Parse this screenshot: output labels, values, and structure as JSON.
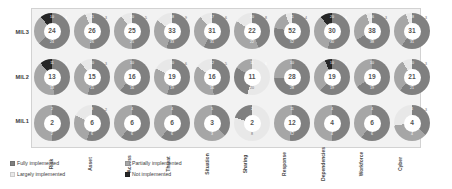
{
  "chart_data": {
    "type": "pie",
    "title": "",
    "subtitle": "",
    "xlabel": "",
    "ylabel": "",
    "grid": false,
    "legend_position": "bottom-left",
    "categories": [
      "Risk",
      "Asset",
      "Access",
      "Threat",
      "Situation",
      "Sharing",
      "Response",
      "Dependencies",
      "Workforce",
      "Cyber"
    ],
    "rows": [
      "MIL3",
      "MIL2",
      "MIL1"
    ],
    "series": [
      {
        "name": "Fully implemented",
        "color": "#808080"
      },
      {
        "name": "Largely implemented",
        "color": "#e8e8e8"
      },
      {
        "name": "Partially implemented",
        "color": "#a6a6a6"
      },
      {
        "name": "Not implemented",
        "color": "#262626"
      }
    ],
    "donuts": [
      {
        "row": "MIL3",
        "category": "Risk",
        "center": "24",
        "segments": [
          {
            "series": "Fully implemented",
            "value": 24,
            "label": "24"
          },
          {
            "series": "Partially implemented",
            "value": 10,
            "label": "10"
          },
          {
            "series": "Not implemented",
            "value": 4,
            "label": "4"
          }
        ]
      },
      {
        "row": "MIL3",
        "category": "Asset",
        "center": "26",
        "segments": [
          {
            "series": "Fully implemented",
            "value": 26,
            "label": "26"
          },
          {
            "series": "Partially implemented",
            "value": 21,
            "label": "21"
          },
          {
            "series": "Largely implemented",
            "value": 3,
            "label": "3"
          }
        ]
      },
      {
        "row": "MIL3",
        "category": "Access",
        "center": "25",
        "segments": [
          {
            "series": "Fully implemented",
            "value": 25,
            "label": "25"
          },
          {
            "series": "Partially implemented",
            "value": 20,
            "label": "20"
          },
          {
            "series": "Largely implemented",
            "value": 5,
            "label": "5"
          }
        ]
      },
      {
        "row": "MIL3",
        "category": "Threat",
        "center": "33",
        "segments": [
          {
            "series": "Fully implemented",
            "value": 33,
            "label": "33"
          },
          {
            "series": "Partially implemented",
            "value": 18,
            "label": "18"
          },
          {
            "series": "Largely implemented",
            "value": 9,
            "label": "9"
          }
        ]
      },
      {
        "row": "MIL3",
        "category": "Situation",
        "center": "31",
        "segments": [
          {
            "series": "Fully implemented",
            "value": 31,
            "label": "31"
          },
          {
            "series": "Partially implemented",
            "value": 17,
            "label": "17"
          },
          {
            "series": "Largely implemented",
            "value": 6,
            "label": "6"
          }
        ]
      },
      {
        "row": "MIL3",
        "category": "Sharing",
        "center": "22",
        "segments": [
          {
            "series": "Fully implemented",
            "value": 22,
            "label": "22"
          },
          {
            "series": "Partially implemented",
            "value": 20,
            "label": "20"
          },
          {
            "series": "Largely implemented",
            "value": 8,
            "label": "8"
          }
        ]
      },
      {
        "row": "MIL3",
        "category": "Response",
        "center": "52",
        "segments": [
          {
            "series": "Fully implemented",
            "value": 52,
            "label": "52"
          },
          {
            "series": "Partially implemented",
            "value": 11,
            "label": "11"
          },
          {
            "series": "Largely implemented",
            "value": 4,
            "label": "4"
          }
        ]
      },
      {
        "row": "MIL3",
        "category": "Dependencies",
        "center": "30",
        "segments": [
          {
            "series": "Fully implemented",
            "value": 30,
            "label": "30"
          },
          {
            "series": "Partially implemented",
            "value": 20,
            "label": "20"
          },
          {
            "series": "Not implemented",
            "value": 6,
            "label": "6"
          }
        ]
      },
      {
        "row": "MIL3",
        "category": "Workforce",
        "center": "38",
        "segments": [
          {
            "series": "Fully implemented",
            "value": 38,
            "label": "38"
          },
          {
            "series": "Partially implemented",
            "value": 16,
            "label": "16"
          },
          {
            "series": "Largely implemented",
            "value": 3,
            "label": "3"
          }
        ]
      },
      {
        "row": "MIL3",
        "category": "Cyber",
        "center": "31",
        "segments": [
          {
            "series": "Fully implemented",
            "value": 31,
            "label": "31"
          },
          {
            "series": "Partially implemented",
            "value": 18,
            "label": "18"
          },
          {
            "series": "Largely implemented",
            "value": 3,
            "label": "3"
          }
        ]
      },
      {
        "row": "MIL2",
        "category": "Risk",
        "center": "13",
        "segments": [
          {
            "series": "Fully implemented",
            "value": 13,
            "label": "13"
          },
          {
            "series": "Partially implemented",
            "value": 11,
            "label": "11"
          },
          {
            "series": "Not implemented",
            "value": 3,
            "label": "3"
          }
        ]
      },
      {
        "row": "MIL2",
        "category": "Asset",
        "center": "15",
        "segments": [
          {
            "series": "Fully implemented",
            "value": 15,
            "label": "15"
          },
          {
            "series": "Partially implemented",
            "value": 10,
            "label": "10"
          },
          {
            "series": "Largely implemented",
            "value": 3,
            "label": "3"
          }
        ]
      },
      {
        "row": "MIL2",
        "category": "Access",
        "center": "16",
        "segments": [
          {
            "series": "Fully implemented",
            "value": 16,
            "label": "16"
          },
          {
            "series": "Partially implemented",
            "value": 10,
            "label": "10"
          }
        ]
      },
      {
        "row": "MIL2",
        "category": "Threat",
        "center": "19",
        "segments": [
          {
            "series": "Fully implemented",
            "value": 19,
            "label": "19"
          },
          {
            "series": "Partially implemented",
            "value": 10,
            "label": "10"
          },
          {
            "series": "Largely implemented",
            "value": 6,
            "label": "6"
          }
        ]
      },
      {
        "row": "MIL2",
        "category": "Situation",
        "center": "16",
        "segments": [
          {
            "series": "Fully implemented",
            "value": 16,
            "label": "16"
          },
          {
            "series": "Partially implemented",
            "value": 12,
            "label": "12"
          },
          {
            "series": "Largely implemented",
            "value": 5,
            "label": "5"
          }
        ]
      },
      {
        "row": "MIL2",
        "category": "Sharing",
        "center": "11",
        "segments": [
          {
            "series": "Largely implemented",
            "value": 20,
            "label": "20"
          },
          {
            "series": "Fully implemented",
            "value": 11,
            "label": "11"
          },
          {
            "series": "Partially implemented",
            "value": 6,
            "label": "6"
          }
        ]
      },
      {
        "row": "MIL2",
        "category": "Response",
        "center": "28",
        "segments": [
          {
            "series": "Fully implemented",
            "value": 28,
            "label": "28"
          },
          {
            "series": "Partially implemented",
            "value": 10,
            "label": "10"
          }
        ]
      },
      {
        "row": "MIL2",
        "category": "Dependencies",
        "center": "19",
        "segments": [
          {
            "series": "Fully implemented",
            "value": 19,
            "label": "19"
          },
          {
            "series": "Partially implemented",
            "value": 10,
            "label": "10"
          },
          {
            "series": "Not implemented",
            "value": 2,
            "label": "2"
          }
        ]
      },
      {
        "row": "MIL2",
        "category": "Workforce",
        "center": "19",
        "segments": [
          {
            "series": "Fully implemented",
            "value": 19,
            "label": "19"
          },
          {
            "series": "Partially implemented",
            "value": 10,
            "label": "10"
          }
        ]
      },
      {
        "row": "MIL2",
        "category": "Cyber",
        "center": "21",
        "segments": [
          {
            "series": "Fully implemented",
            "value": 21,
            "label": "21"
          },
          {
            "series": "Partially implemented",
            "value": 10,
            "label": "10"
          },
          {
            "series": "Largely implemented",
            "value": 3,
            "label": "3"
          }
        ]
      },
      {
        "row": "MIL1",
        "category": "Risk",
        "center": "2",
        "segments": [
          {
            "series": "Fully implemented",
            "value": 2,
            "label": "2"
          },
          {
            "series": "Partially implemented",
            "value": 2,
            "label": "2"
          }
        ]
      },
      {
        "row": "MIL1",
        "category": "Asset",
        "center": "6",
        "segments": [
          {
            "series": "Fully implemented",
            "value": 6,
            "label": "6"
          },
          {
            "series": "Partially implemented",
            "value": 3,
            "label": "3"
          },
          {
            "series": "Largely implemented",
            "value": 2,
            "label": "2"
          }
        ]
      },
      {
        "row": "MIL1",
        "category": "Access",
        "center": "6",
        "segments": [
          {
            "series": "Fully implemented",
            "value": 6,
            "label": "6"
          },
          {
            "series": "Partially implemented",
            "value": 4,
            "label": "4"
          }
        ]
      },
      {
        "row": "MIL1",
        "category": "Threat",
        "center": "6",
        "segments": [
          {
            "series": "Fully implemented",
            "value": 6,
            "label": "6"
          },
          {
            "series": "Partially implemented",
            "value": 4,
            "label": "4"
          }
        ]
      },
      {
        "row": "MIL1",
        "category": "Situation",
        "center": "3",
        "segments": [
          {
            "series": "Fully implemented",
            "value": 3,
            "label": "3"
          },
          {
            "series": "Partially implemented",
            "value": 5,
            "label": "5"
          }
        ]
      },
      {
        "row": "MIL1",
        "category": "Sharing",
        "center": "2",
        "segments": [
          {
            "series": "Largely implemented",
            "value": 8,
            "label": "8"
          },
          {
            "series": "Fully implemented",
            "value": 2,
            "label": "2"
          }
        ]
      },
      {
        "row": "MIL1",
        "category": "Response",
        "center": "12",
        "segments": [
          {
            "series": "Fully implemented",
            "value": 12,
            "label": "12"
          },
          {
            "series": "Partially implemented",
            "value": 11,
            "label": "11"
          }
        ]
      },
      {
        "row": "MIL1",
        "category": "Dependencies",
        "center": "4",
        "segments": [
          {
            "series": "Fully implemented",
            "value": 4,
            "label": "4"
          },
          {
            "series": "Partially implemented",
            "value": 4,
            "label": "4"
          }
        ]
      },
      {
        "row": "MIL1",
        "category": "Workforce",
        "center": "6",
        "segments": [
          {
            "series": "Fully implemented",
            "value": 6,
            "label": "6"
          },
          {
            "series": "Partially implemented",
            "value": 4,
            "label": "4"
          }
        ]
      },
      {
        "row": "MIL1",
        "category": "Cyber",
        "center": "4",
        "segments": [
          {
            "series": "Fully implemented",
            "value": 4,
            "label": "4"
          },
          {
            "series": "Partially implemented",
            "value": 4,
            "label": "4"
          },
          {
            "series": "Largely implemented",
            "value": 3,
            "label": "3"
          }
        ]
      }
    ]
  },
  "rows": {
    "mil3": "MIL3",
    "mil2": "MIL2",
    "mil1": "MIL1"
  },
  "legend": {
    "items": [
      {
        "label": "Fully implemented",
        "color": "#808080"
      },
      {
        "label": "Partially implemented",
        "color": "#a6a6a6"
      },
      {
        "label": "Largely implemented",
        "color": "#e8e8e8"
      },
      {
        "label": "Not implemented",
        "color": "#262626"
      }
    ]
  },
  "colors": {
    "fully": "#808080",
    "largely": "#e8e8e8",
    "partially": "#a6a6a6",
    "not": "#262626",
    "plot_background": "#f2f2f2",
    "page_background": "#ffffff"
  }
}
